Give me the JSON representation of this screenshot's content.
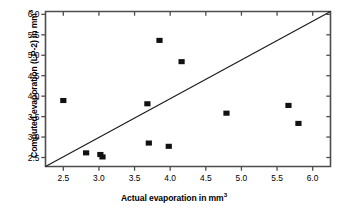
{
  "chart_data": {
    "type": "scatter",
    "title": "",
    "xlabel": "Actual evaporation in mm³",
    "ylabel": "Computed evaporation (LP-2) in mm³",
    "xlabel_text": "Actual evaporation in mm",
    "xlabel_sup": "3",
    "ylabel_text": "Computed evaporation (LP-2) in mm",
    "ylabel_sup": "3",
    "xlim": [
      2.25,
      6.25
    ],
    "ylim": [
      2.28,
      6.07
    ],
    "xticks": [
      2.5,
      3.0,
      3.5,
      4.0,
      4.5,
      5.0,
      5.5,
      6.0
    ],
    "xtick_labels": [
      "2.5",
      "3.0",
      "3.5",
      "4.0",
      "4.5",
      "5.0",
      "5.5",
      "6.0"
    ],
    "yticks": [
      2.5,
      3.0,
      3.5,
      4.0,
      4.5,
      5.0,
      5.5,
      6.0
    ],
    "ytick_labels": [
      "2.5",
      "3.0",
      "3.5",
      "4.0",
      "4.5",
      "5.0",
      "5.5",
      "6.0"
    ],
    "grid": false,
    "legend": null,
    "marker": "square",
    "marker_color": "#111111",
    "line_color": "#1a1a1a",
    "axis_color": "#4d4d4d",
    "background": "#ffffff",
    "reference_line": {
      "name": "1:1 line",
      "from": [
        2.25,
        2.28
      ],
      "to": [
        6.25,
        6.07
      ]
    },
    "x": [
      2.5,
      2.82,
      3.02,
      3.05,
      3.68,
      3.7,
      3.85,
      3.98,
      4.16,
      4.79,
      5.66,
      5.8
    ],
    "y": [
      3.88,
      2.6,
      2.56,
      2.5,
      3.8,
      2.84,
      5.35,
      2.76,
      4.83,
      3.57,
      3.76,
      3.32
    ],
    "points": [
      {
        "x": 2.5,
        "y": 3.88
      },
      {
        "x": 2.82,
        "y": 2.6
      },
      {
        "x": 3.02,
        "y": 2.56
      },
      {
        "x": 3.05,
        "y": 2.5
      },
      {
        "x": 3.68,
        "y": 3.8
      },
      {
        "x": 3.7,
        "y": 2.84
      },
      {
        "x": 3.85,
        "y": 5.35
      },
      {
        "x": 3.98,
        "y": 2.76
      },
      {
        "x": 4.16,
        "y": 4.83
      },
      {
        "x": 4.79,
        "y": 3.57
      },
      {
        "x": 5.66,
        "y": 3.76
      },
      {
        "x": 5.8,
        "y": 3.32
      }
    ]
  }
}
